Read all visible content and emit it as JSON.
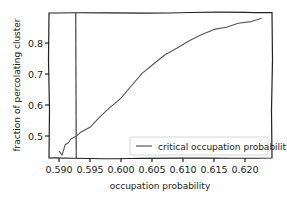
{
  "chart_data": {
    "type": "line",
    "title": "",
    "xlabel": "occupation probability",
    "ylabel": "fraction of percolating cluster",
    "xlim": [
      0.5885,
      0.6235
    ],
    "ylim": [
      0.42,
      0.9
    ],
    "x_ticks": [
      "0.590",
      "0.595",
      "0.600",
      "0.605",
      "0.610",
      "0.615",
      "0.620"
    ],
    "y_ticks": [
      "0.5",
      "0.6",
      "0.7",
      "0.8"
    ],
    "grid": false,
    "legend_position": "lower right",
    "series": [
      {
        "name": "fraction of percolating cluster",
        "color": "#555555",
        "x": [
          0.59,
          0.5905,
          0.591,
          0.5915,
          0.592,
          0.5927,
          0.5935,
          0.595,
          0.5966,
          0.598,
          0.6,
          0.6015,
          0.6034,
          0.605,
          0.6071,
          0.609,
          0.611,
          0.6127,
          0.615,
          0.617,
          0.6189,
          0.621,
          0.6227
        ],
        "values": [
          0.45,
          0.44,
          0.47,
          0.48,
          0.49,
          0.5,
          0.51,
          0.53,
          0.56,
          0.59,
          0.62,
          0.66,
          0.7,
          0.73,
          0.76,
          0.785,
          0.805,
          0.826,
          0.842,
          0.853,
          0.862,
          0.871,
          0.878
        ]
      }
    ],
    "annotations": [
      {
        "type": "vline",
        "x": 0.5927,
        "label": "critical occupation probability",
        "color": "#333333"
      }
    ]
  },
  "legend": {
    "entries": [
      {
        "label": "critical occupation probability",
        "color": "#555555"
      }
    ]
  }
}
